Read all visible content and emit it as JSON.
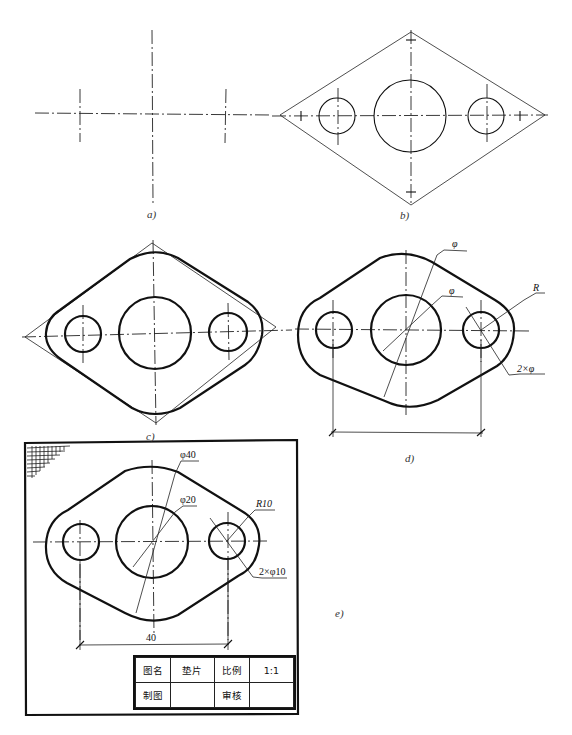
{
  "figure": {
    "subfigures": [
      {
        "id": "a",
        "label": "a)",
        "description": "Centerlines for three holes"
      },
      {
        "id": "b",
        "label": "b)",
        "description": "Construction: circles and rhombus tangent lines"
      },
      {
        "id": "c",
        "label": "c)",
        "description": "Outline thickened with fillets"
      },
      {
        "id": "d",
        "label": "d)",
        "description": "Dimension lines without values"
      },
      {
        "id": "e",
        "label": "e)",
        "description": "Finished drawing with frame and title block"
      }
    ],
    "d_dimensions": {
      "outer_dia": "φ",
      "inner_dia": "φ",
      "radius": "R",
      "small_holes": "2×φ"
    },
    "e_dimensions": {
      "outer_dia": "φ40",
      "inner_dia": "φ20",
      "radius": "R10",
      "small_holes": "2×φ10",
      "center_distance": "40"
    },
    "title_block": {
      "row1": [
        "图名",
        "垫片",
        "比例",
        "1:1"
      ],
      "row2": [
        "制图",
        "",
        "审核",
        ""
      ]
    }
  }
}
